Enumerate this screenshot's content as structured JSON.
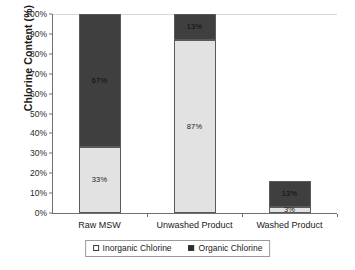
{
  "chart_data": {
    "type": "bar",
    "subtype": "stacked-bar",
    "title": "",
    "xlabel": "",
    "ylabel": "Chlorine Content (%)",
    "ylim": [
      0,
      100
    ],
    "yunit": "%",
    "grid": false,
    "legend_position": "bottom",
    "categories": [
      "Raw MSW",
      "Unwashed Product",
      "Washed Product"
    ],
    "series": [
      {
        "name": "Inorganic Chlorine",
        "color": "#e2e2e2",
        "marker": "hollow-square",
        "values": [
          33,
          87,
          3
        ],
        "labels": [
          "33%",
          "87%",
          "3%"
        ]
      },
      {
        "name": "Organic Chlorine",
        "color": "#3f3f3f",
        "marker": "filled-square",
        "values": [
          67,
          13,
          13
        ],
        "labels": [
          "67%",
          "13%",
          "13%"
        ]
      }
    ],
    "ytick_labels": [
      "100%",
      "90%",
      "80%",
      "70%",
      "60%",
      "50%",
      "40%",
      "30%",
      "20%",
      "10%",
      "0%"
    ],
    "ytick_values": [
      100,
      90,
      80,
      70,
      60,
      50,
      40,
      30,
      20,
      10,
      0
    ]
  },
  "legend": {
    "items": [
      {
        "label": "Inorganic Chlorine",
        "marker": "hollow-square"
      },
      {
        "label": "Organic Chlorine",
        "marker": "filled-square"
      }
    ]
  }
}
